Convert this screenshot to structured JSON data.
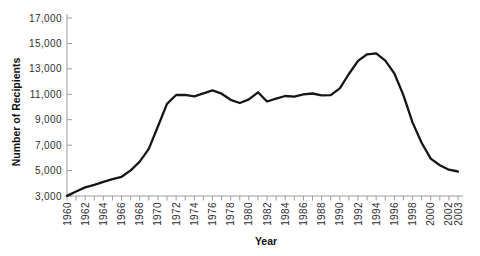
{
  "figure": {
    "background": "#ffffff"
  },
  "chart_data": {
    "type": "line",
    "title": "",
    "xlabel": "Year",
    "ylabel": "Number of Recipients",
    "x": [
      1960,
      1961,
      1962,
      1963,
      1964,
      1965,
      1966,
      1967,
      1968,
      1969,
      1970,
      1971,
      1972,
      1973,
      1974,
      1975,
      1976,
      1977,
      1978,
      1979,
      1980,
      1981,
      1982,
      1983,
      1984,
      1985,
      1986,
      1987,
      1988,
      1989,
      1990,
      1991,
      1992,
      1993,
      1994,
      1995,
      1996,
      1997,
      1998,
      1999,
      2000,
      2001,
      2002,
      2003
    ],
    "values": [
      3005,
      3354,
      3676,
      3876,
      4118,
      4329,
      4513,
      5014,
      5705,
      6706,
      8466,
      10241,
      10947,
      10949,
      10845,
      11067,
      11304,
      11050,
      10570,
      10312,
      10597,
      11160,
      10431,
      10659,
      10866,
      10813,
      10997,
      11065,
      10920,
      10934,
      11460,
      12592,
      13625,
      14143,
      14226,
      13652,
      12649,
      10936,
      8790,
      7188,
      5943,
      5420,
      5069,
      4929
    ],
    "xlim": [
      1960,
      2003
    ],
    "ylim": [
      3000,
      17000
    ],
    "y_ticks": [
      3000,
      5000,
      7000,
      9000,
      11000,
      13000,
      15000,
      17000
    ],
    "y_tick_labels": [
      "3,000",
      "5,000",
      "7,000",
      "9,000",
      "11,000",
      "13,000",
      "15,000",
      "17,000"
    ],
    "x_tick_step": 1,
    "x_labeled_years": [
      1960,
      1962,
      1964,
      1966,
      1968,
      1970,
      1972,
      1974,
      1976,
      1978,
      1980,
      1982,
      1984,
      1986,
      1988,
      1990,
      1992,
      1994,
      1996,
      1998,
      2000,
      2002,
      2003
    ],
    "grid": false,
    "legend": "none",
    "line_color": "#161616",
    "axis_color": "#9c9c9c",
    "label_color": "#2e2e2e"
  }
}
